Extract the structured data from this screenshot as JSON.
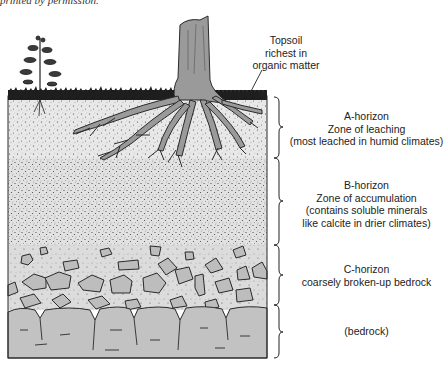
{
  "caption": {
    "partial_text": "printed by permission."
  },
  "figure": {
    "topsoil_label": [
      "Topsoil",
      "richest in",
      "organic matter"
    ],
    "horizons": [
      {
        "id": "A",
        "lines": [
          "A-horizon",
          "Zone of leaching",
          "(most leached in humid climates)"
        ]
      },
      {
        "id": "B",
        "lines": [
          "B-horizon",
          "Zone of accumulation",
          "(contains soluble minerals",
          "like calcite in drier climates)"
        ]
      },
      {
        "id": "C",
        "lines": [
          "C-horizon",
          "coarsely broken-up bedrock"
        ]
      },
      {
        "id": "R",
        "lines": [
          "(bedrock)"
        ]
      }
    ],
    "colors": {
      "soil_light": "#e6e6e6",
      "soil_mid": "#d4d4d4",
      "rock": "#bdbdbd",
      "bedrock": "#c2c2c2",
      "outline": "#2a2a2a",
      "grass": "#1e1e1e",
      "trunk": "#9a9a9a"
    }
  }
}
